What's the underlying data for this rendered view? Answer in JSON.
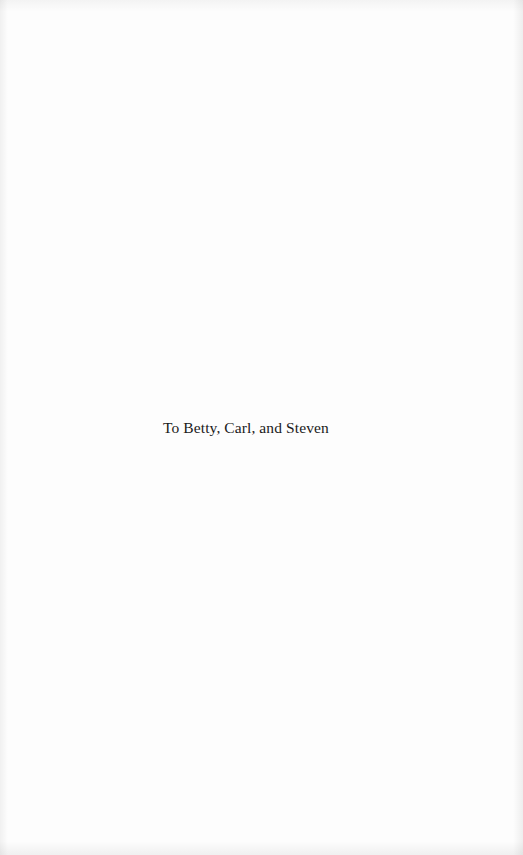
{
  "page": {
    "type": "dedication",
    "dedication_text": "To Betty, Carl, and Steven"
  }
}
